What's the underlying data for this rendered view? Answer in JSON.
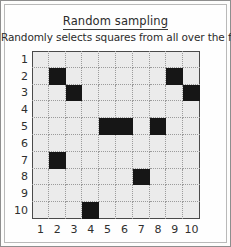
{
  "figure": {
    "title": "Random sampling",
    "subtitle": "Randomly selects squares from all over the field.",
    "title_underlined": true,
    "border_color": "#8e8e8e",
    "grid_background": "#ebebeb",
    "grid_border_color": "#4a4a4a",
    "gridline_color": "#9b9b9b",
    "sample_color": "#161616"
  },
  "chart_data": {
    "type": "heatmap",
    "title": "Random sampling",
    "subtitle": "Randomly selects squares from all over the field.",
    "xlabel": "",
    "ylabel": "",
    "grid": true,
    "legend": "none",
    "rows": 10,
    "cols": 10,
    "x": [
      1,
      2,
      3,
      4,
      5,
      6,
      7,
      8,
      9,
      10
    ],
    "y": [
      1,
      2,
      3,
      4,
      5,
      6,
      7,
      8,
      9,
      10
    ],
    "x_tick_labels": [
      "1",
      "2",
      "3",
      "4",
      "5",
      "6",
      "7",
      "8",
      "9",
      "10"
    ],
    "y_tick_labels": [
      "1",
      "2",
      "3",
      "4",
      "5",
      "6",
      "7",
      "8",
      "9",
      "10"
    ],
    "y_axis_direction": "top-to-bottom",
    "value_legend": {
      "0": "not sampled",
      "1": "sampled"
    },
    "sampled_count": 10,
    "sampled_cells": [
      {
        "col": 2,
        "row": 2
      },
      {
        "col": 9,
        "row": 2
      },
      {
        "col": 3,
        "row": 3
      },
      {
        "col": 10,
        "row": 3
      },
      {
        "col": 5,
        "row": 5
      },
      {
        "col": 6,
        "row": 5
      },
      {
        "col": 8,
        "row": 5
      },
      {
        "col": 2,
        "row": 7
      },
      {
        "col": 7,
        "row": 8
      },
      {
        "col": 4,
        "row": 10
      }
    ],
    "matrix": [
      [
        0,
        0,
        0,
        0,
        0,
        0,
        0,
        0,
        0,
        0
      ],
      [
        0,
        1,
        0,
        0,
        0,
        0,
        0,
        0,
        1,
        0
      ],
      [
        0,
        0,
        1,
        0,
        0,
        0,
        0,
        0,
        0,
        1
      ],
      [
        0,
        0,
        0,
        0,
        0,
        0,
        0,
        0,
        0,
        0
      ],
      [
        0,
        0,
        0,
        0,
        1,
        1,
        0,
        1,
        0,
        0
      ],
      [
        0,
        0,
        0,
        0,
        0,
        0,
        0,
        0,
        0,
        0
      ],
      [
        0,
        1,
        0,
        0,
        0,
        0,
        0,
        0,
        0,
        0
      ],
      [
        0,
        0,
        0,
        0,
        0,
        0,
        1,
        0,
        0,
        0
      ],
      [
        0,
        0,
        0,
        0,
        0,
        0,
        0,
        0,
        0,
        0
      ],
      [
        0,
        0,
        0,
        1,
        0,
        0,
        0,
        0,
        0,
        0
      ]
    ]
  }
}
